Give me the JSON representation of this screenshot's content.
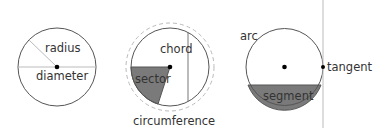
{
  "diagram": {
    "colors": {
      "stroke": "#555555",
      "light_line": "#bbbbbb",
      "fill_shaded": "#7a7a7a",
      "dot": "#000000",
      "dashed": "#bbbbbb",
      "text": "#333333"
    },
    "panels": [
      {
        "id": "panel-1",
        "labels": {
          "radius": "radius",
          "diameter": "diameter"
        }
      },
      {
        "id": "panel-2",
        "labels": {
          "chord": "chord",
          "sector": "sector",
          "circumference": "circumference"
        }
      },
      {
        "id": "panel-3",
        "labels": {
          "arc": "arc",
          "tangent": "tangent",
          "segment": "segment"
        }
      }
    ]
  }
}
